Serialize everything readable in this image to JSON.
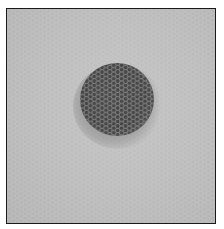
{
  "image": {
    "description": "Grayscale photograph of a hexagonal honeycomb mesh draped over a dark circular object, framed by a thin black border",
    "colors": {
      "background": "#bdbdbd",
      "disc": "#4a4a4a",
      "mesh_on_disc": "#b0b0b0",
      "mesh_on_background": "#d0d0d0",
      "border": "#1a1a1a"
    }
  }
}
